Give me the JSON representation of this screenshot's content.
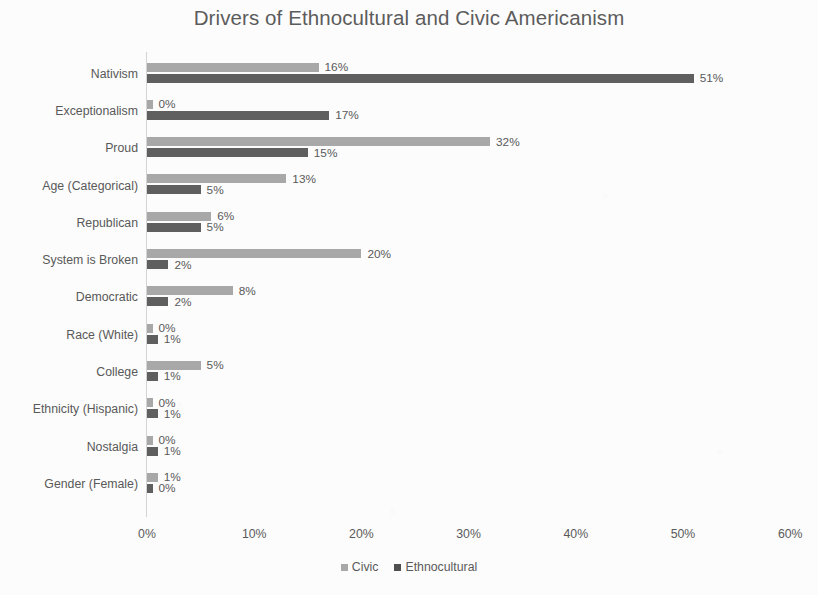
{
  "chart_data": {
    "type": "bar",
    "orientation": "horizontal",
    "title": "Drivers of Ethnocultural and Civic Americanism",
    "xlabel": "",
    "ylabel": "",
    "xlim": [
      0,
      60
    ],
    "x_unit": "%",
    "grid": false,
    "legend_position": "bottom",
    "axis_tick_labels": [
      "0%",
      "10%",
      "20%",
      "30%",
      "40%",
      "50%",
      "60%"
    ],
    "axis_tick_values": [
      0,
      10,
      20,
      30,
      40,
      50,
      60
    ],
    "categories": [
      "Nativism",
      "Exceptionalism",
      "Proud",
      "Age (Categorical)",
      "Republican",
      "System is Broken",
      "Democratic",
      "Race (White)",
      "College",
      "Ethnicity (Hispanic)",
      "Nostalgia",
      "Gender (Female)"
    ],
    "series": [
      {
        "name": "Civic",
        "color": "#a8a8a8",
        "values": [
          16,
          0,
          32,
          13,
          6,
          20,
          8,
          0,
          5,
          0,
          0,
          1
        ],
        "labels": [
          "16%",
          "0%",
          "32%",
          "13%",
          "6%",
          "20%",
          "8%",
          "0%",
          "5%",
          "0%",
          "0%",
          "1%"
        ]
      },
      {
        "name": "Ethnocultural",
        "color": "#5f5f5f",
        "values": [
          51,
          17,
          15,
          5,
          5,
          2,
          2,
          1,
          1,
          1,
          1,
          0
        ],
        "labels": [
          "51%",
          "17%",
          "15%",
          "5%",
          "5%",
          "2%",
          "2%",
          "1%",
          "1%",
          "1%",
          "1%",
          "0%"
        ]
      }
    ]
  },
  "legend": {
    "entries": [
      {
        "label": "Civic"
      },
      {
        "label": "Ethnocultural"
      }
    ]
  }
}
